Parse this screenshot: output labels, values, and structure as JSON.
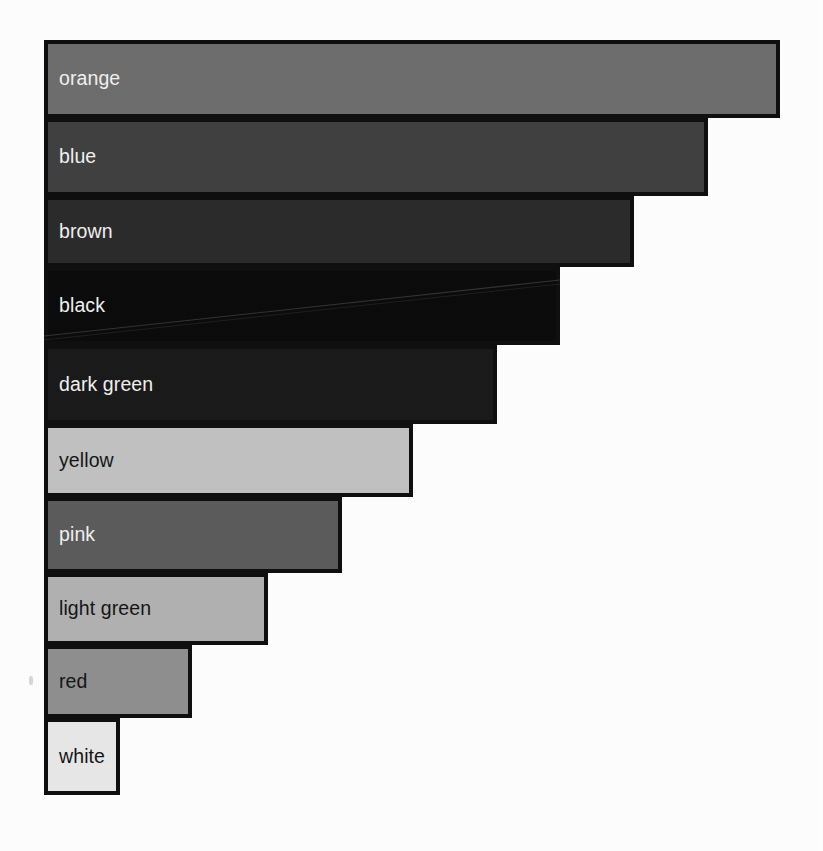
{
  "chart_data": {
    "type": "bar",
    "orientation": "horizontal",
    "title": "",
    "subtitle": "",
    "xlabel": "",
    "ylabel": "",
    "grid": false,
    "legend": "none",
    "axes_visible": false,
    "tick_labels_visible": false,
    "note": "Grayscale scanned horizontal bar chart; each bar is labelled inside with a colour name and sorted from longest to shortest.",
    "categories": [
      "orange",
      "blue",
      "brown",
      "black",
      "dark green",
      "yellow",
      "pink",
      "light green",
      "red",
      "white"
    ],
    "values": [
      100,
      90.2,
      80.1,
      70.0,
      61.6,
      50.2,
      40.5,
      30.5,
      20.1,
      10.3
    ],
    "xlim": [
      0,
      100
    ],
    "bars": [
      {
        "label": "orange",
        "value": 100,
        "x": 44,
        "y": 40,
        "width": 736,
        "height": 78,
        "fill": "#6e6e6e",
        "stroke": "#101010",
        "label_color": "#f2f2f2"
      },
      {
        "label": "blue",
        "value": 90.2,
        "x": 44,
        "y": 118,
        "width": 664,
        "height": 78,
        "fill": "#414141",
        "stroke": "#101010",
        "label_color": "#f2f2f2"
      },
      {
        "label": "brown",
        "value": 80.1,
        "x": 44,
        "y": 196,
        "width": 590,
        "height": 71,
        "fill": "#2c2c2c",
        "stroke": "#101010",
        "label_color": "#f2f2f2"
      },
      {
        "label": "black",
        "value": 70.0,
        "x": 44,
        "y": 267,
        "width": 516,
        "height": 78,
        "fill": "#0c0c0c",
        "stroke": "#101010",
        "label_color": "#f2f2f2"
      },
      {
        "label": "dark green",
        "value": 61.6,
        "x": 44,
        "y": 345,
        "width": 453,
        "height": 79,
        "fill": "#1b1b1b",
        "stroke": "#101010",
        "label_color": "#f2f2f2"
      },
      {
        "label": "yellow",
        "value": 50.2,
        "x": 44,
        "y": 424,
        "width": 369,
        "height": 73,
        "fill": "#c2c2c2",
        "stroke": "#101010",
        "label_color": "#161616"
      },
      {
        "label": "pink",
        "value": 40.5,
        "x": 44,
        "y": 497,
        "width": 298,
        "height": 76,
        "fill": "#5c5c5c",
        "stroke": "#101010",
        "label_color": "#f2f2f2"
      },
      {
        "label": "light green",
        "value": 30.5,
        "x": 44,
        "y": 573,
        "width": 224,
        "height": 72,
        "fill": "#b2b2b2",
        "stroke": "#101010",
        "label_color": "#161616"
      },
      {
        "label": "red",
        "value": 20.1,
        "x": 44,
        "y": 645,
        "width": 148,
        "height": 73,
        "fill": "#909090",
        "stroke": "#101010",
        "label_color": "#161616"
      },
      {
        "label": "white",
        "value": 10.3,
        "x": 44,
        "y": 718,
        "width": 76,
        "height": 77,
        "fill": "#e9e9e9",
        "stroke": "#101010",
        "label_color": "#161616"
      }
    ],
    "background": "#ffffff"
  }
}
